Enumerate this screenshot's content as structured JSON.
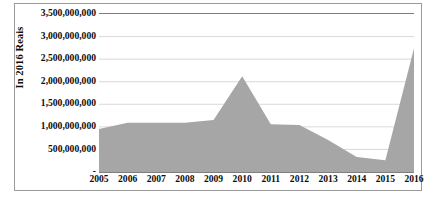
{
  "chart_data": {
    "type": "area",
    "title": "",
    "xlabel": "",
    "ylabel": "In 2016 Reais",
    "categories": [
      "2005",
      "2006",
      "2007",
      "2008",
      "2009",
      "2010",
      "2011",
      "2012",
      "2013",
      "2014",
      "2015",
      "2016"
    ],
    "values": [
      950000000,
      1090000000,
      1090000000,
      1090000000,
      1150000000,
      2120000000,
      1060000000,
      1040000000,
      710000000,
      330000000,
      260000000,
      2740000000
    ],
    "series": [
      {
        "name": "In 2016 Reais",
        "values": [
          950000000,
          1090000000,
          1090000000,
          1090000000,
          1150000000,
          2120000000,
          1060000000,
          1040000000,
          710000000,
          330000000,
          260000000,
          2740000000
        ]
      }
    ],
    "ylim": [
      0,
      3500000000
    ],
    "ytick_values": [
      0,
      500000000,
      1000000000,
      1500000000,
      2000000000,
      2500000000,
      3000000000,
      3500000000
    ],
    "ytick_labels": [
      "-",
      "500,000,000",
      "1,000,000,000",
      "1,500,000,000",
      "2,000,000,000",
      "2,500,000,000",
      "3,000,000,000",
      "3,500,000,000"
    ],
    "grid": true,
    "legend": "none",
    "colors": {
      "area_fill": "#a6a6a6",
      "grid_line": "#d9d9d9",
      "axis_line": "#7f7f7f",
      "frame_border": "#9a9a9a",
      "text": "#0d0d0d",
      "plot_background": "#ffffff"
    }
  }
}
